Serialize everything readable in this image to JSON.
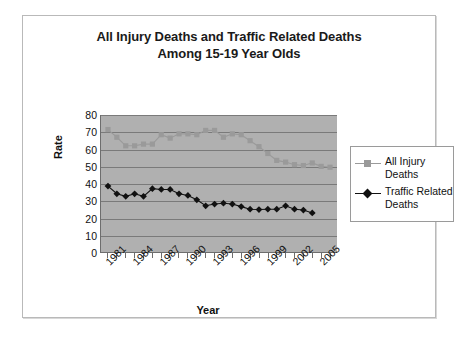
{
  "chart_data": {
    "type": "line",
    "title": "All Injury Deaths and Traffic Related Deaths Among 15-19 Year Olds",
    "title_line1": "All Injury Deaths and Traffic Related Deaths",
    "title_line2": "Among 15-19 Year Olds",
    "xlabel": "Year",
    "ylabel": "Rate",
    "ylim": [
      0,
      80
    ],
    "yticks": [
      0,
      10,
      20,
      30,
      40,
      50,
      60,
      70,
      80
    ],
    "grid": true,
    "legend_position": "right",
    "plot_background": "#b0b0b0",
    "x": [
      1981,
      1982,
      1983,
      1984,
      1985,
      1986,
      1987,
      1988,
      1989,
      1990,
      1991,
      1992,
      1993,
      1994,
      1995,
      1996,
      1997,
      1998,
      1999,
      2000,
      2001,
      2002,
      2003,
      2004,
      2005,
      2006
    ],
    "xtick_labels": [
      "1981",
      "1984",
      "1987",
      "1990",
      "1993",
      "1996",
      "1999",
      "2002",
      "2005"
    ],
    "xtick_values": [
      1981,
      1984,
      1987,
      1990,
      1993,
      1996,
      1999,
      2002,
      2005
    ],
    "series": [
      {
        "name": "All Injury Deaths",
        "color": "#9a9a9a",
        "marker": "square",
        "values": [
          71.5,
          67.0,
          62.0,
          62.0,
          63.0,
          63.0,
          68.5,
          66.5,
          69.0,
          69.0,
          68.5,
          71.0,
          71.0,
          67.0,
          69.0,
          68.5,
          65.0,
          61.5,
          57.5,
          53.5,
          52.5,
          51.0,
          50.5,
          52.0,
          50.0,
          49.5
        ]
      },
      {
        "name": "Traffic Related Deaths",
        "color": "#111111",
        "marker": "diamond",
        "values": [
          38.5,
          34.0,
          32.5,
          34.0,
          32.5,
          37.0,
          36.5,
          36.5,
          34.0,
          33.0,
          30.5,
          27.0,
          28.0,
          28.5,
          28.0,
          26.5,
          25.0,
          24.8,
          25.0,
          25.0,
          27.0,
          25.0,
          24.5,
          22.8,
          null,
          null
        ]
      }
    ]
  },
  "legend": {
    "entries": [
      {
        "label": "All Injury Deaths"
      },
      {
        "label": "Traffic Related Deaths"
      }
    ]
  }
}
